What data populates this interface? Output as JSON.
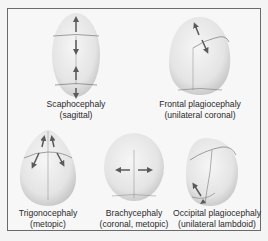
{
  "figure": {
    "panels": [
      {
        "id": "scaphocephaly",
        "title": "Scaphocephaly",
        "subtitle": "(sagittal)"
      },
      {
        "id": "frontal-plagiocephaly",
        "title": "Frontal plagiocephaly",
        "subtitle": "(unilateral coronal)"
      },
      {
        "id": "trigonocephaly",
        "title": "Trigonocephaly",
        "subtitle": "(metopic)"
      },
      {
        "id": "brachycephaly",
        "title": "Brachycephaly",
        "subtitle": "(coronal, metopic)"
      },
      {
        "id": "occipital-plagiocephaly",
        "title": "Occipital plagiocephaly",
        "subtitle": "(unilateral lambdoid)"
      }
    ],
    "colors": {
      "border": "#6a6a6a",
      "skull_light": "#f2f2f2",
      "skull_dark": "#c9c9c9",
      "suture": "#7a7a7a",
      "arrow": "#5a5a5a",
      "text": "#2a2a2a"
    }
  }
}
